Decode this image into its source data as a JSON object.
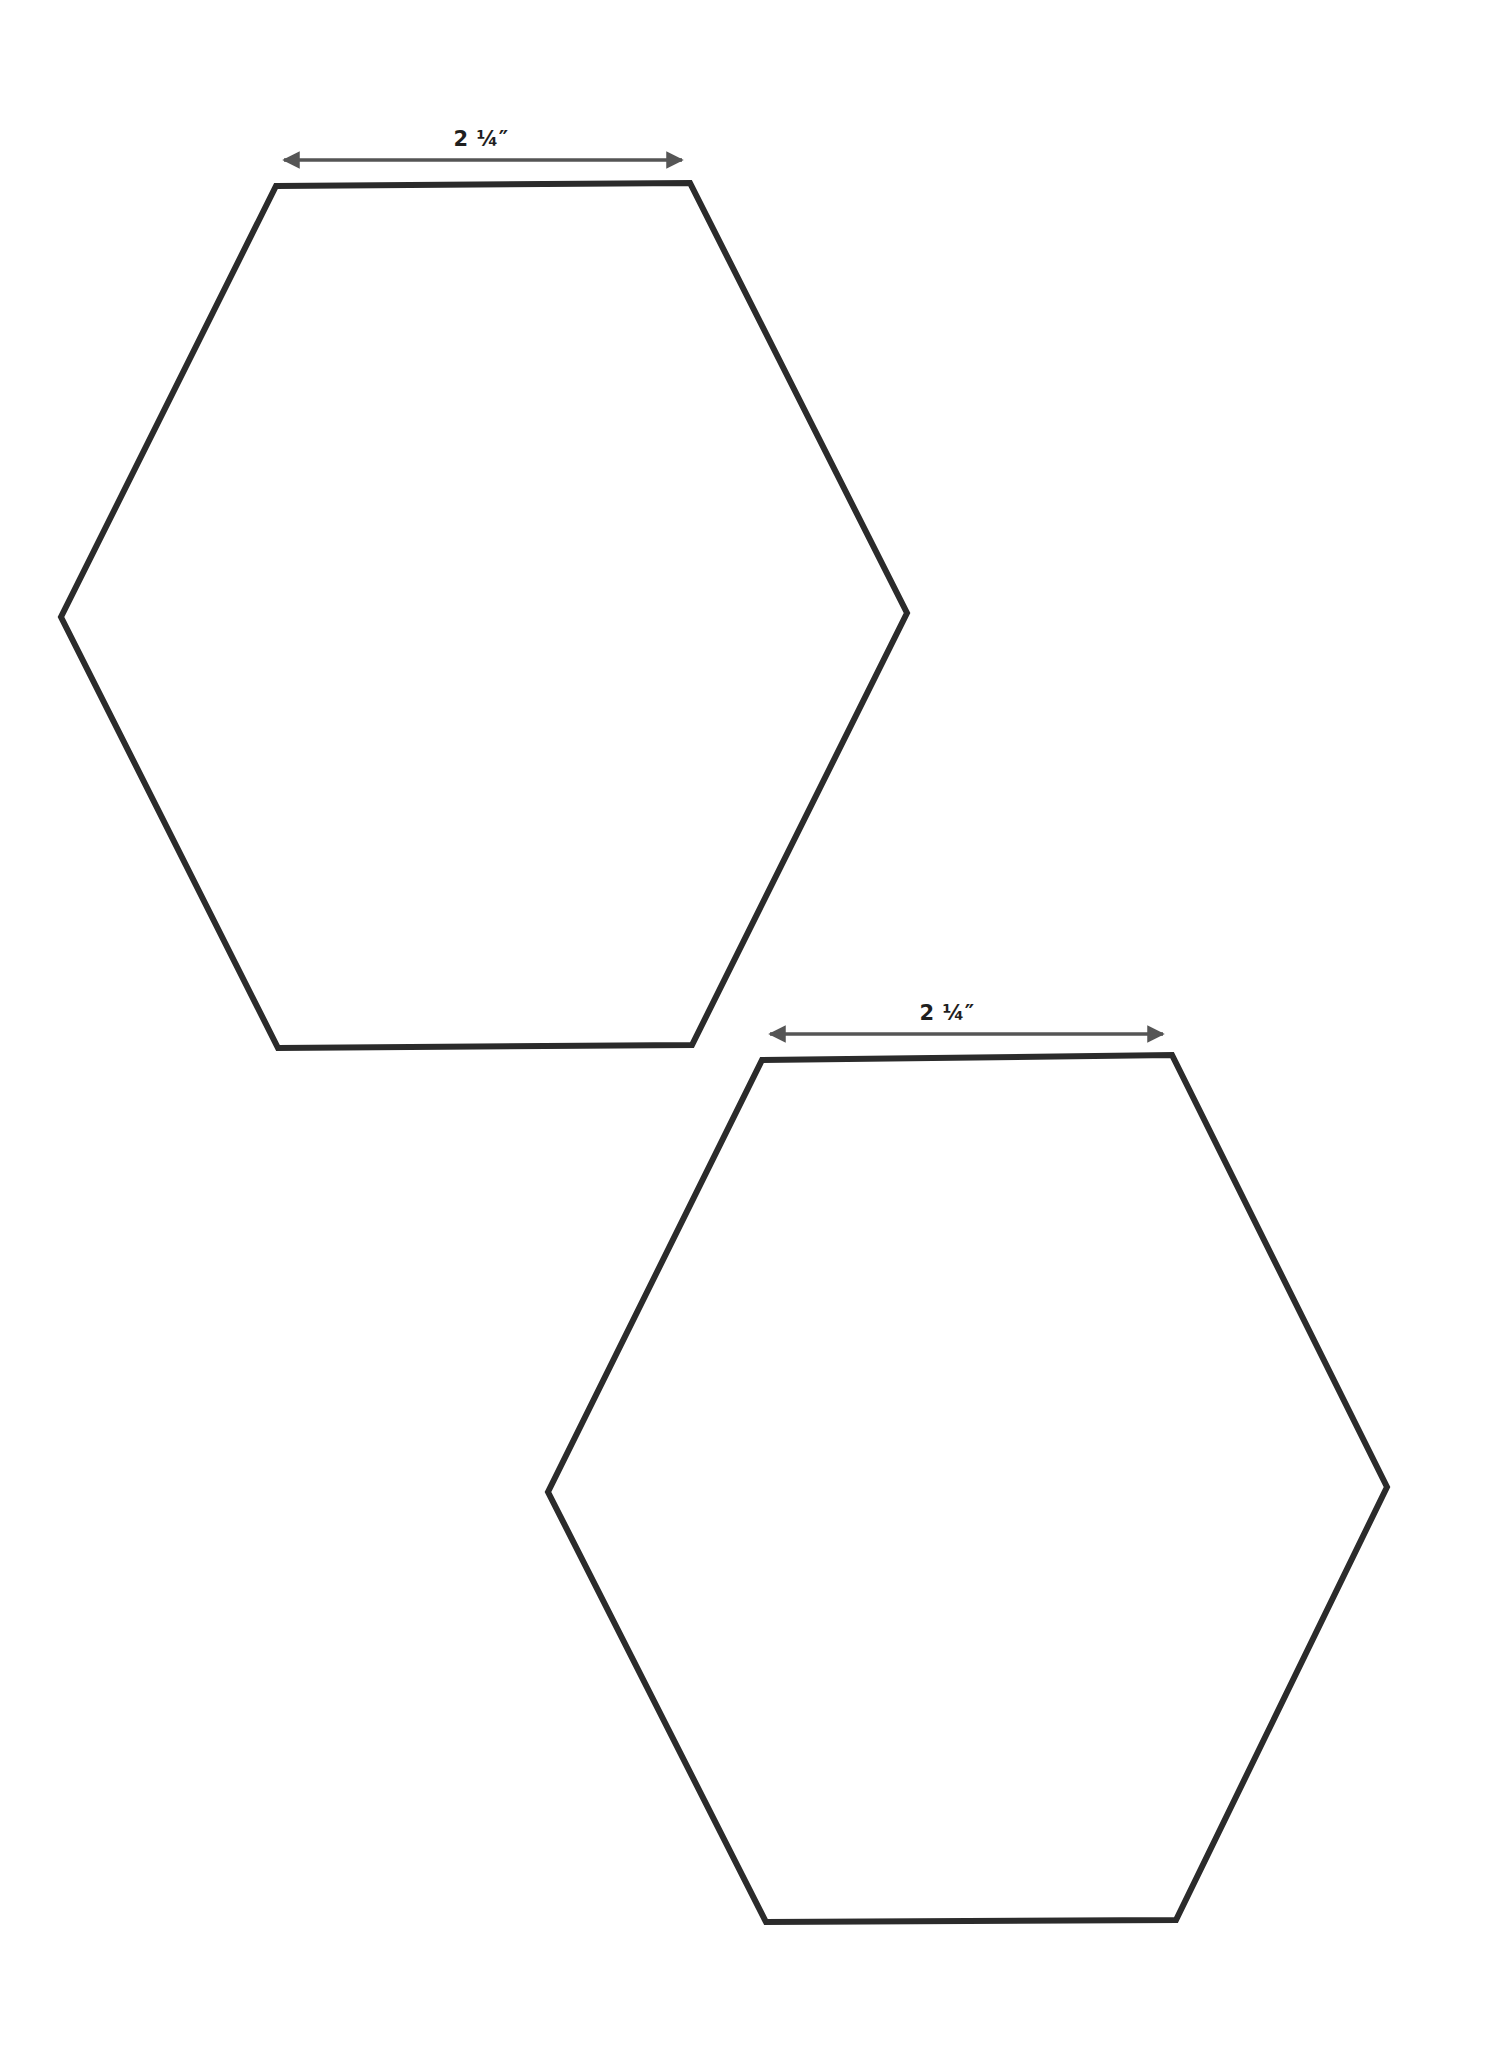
{
  "page": {
    "background": "#ffffff",
    "width": 1494,
    "height": 2055
  },
  "colors": {
    "hex_stroke": "#2b2b2b",
    "arrow": "#555555",
    "label": "#1f1f1f"
  },
  "templates": [
    {
      "id": "hexagon-1",
      "shape": "hexagon",
      "side_label": "2 ¼″",
      "vertices": [
        [
          276,
          186
        ],
        [
          690,
          183
        ],
        [
          907,
          613
        ],
        [
          692,
          1045
        ],
        [
          278,
          1048
        ],
        [
          61,
          617
        ]
      ],
      "arrow": {
        "x1": 284,
        "x2": 682,
        "y": 160
      },
      "label_pos": {
        "x": 481,
        "y": 129
      }
    },
    {
      "id": "hexagon-2",
      "shape": "hexagon",
      "side_label": "2 ¼″",
      "vertices": [
        [
          762,
          1060
        ],
        [
          1172,
          1055
        ],
        [
          1387,
          1487
        ],
        [
          1176,
          1920
        ],
        [
          766,
          1922
        ],
        [
          548,
          1492
        ]
      ],
      "arrow": {
        "x1": 770,
        "x2": 1163,
        "y": 1034
      },
      "label_pos": {
        "x": 947,
        "y": 1003
      }
    }
  ]
}
